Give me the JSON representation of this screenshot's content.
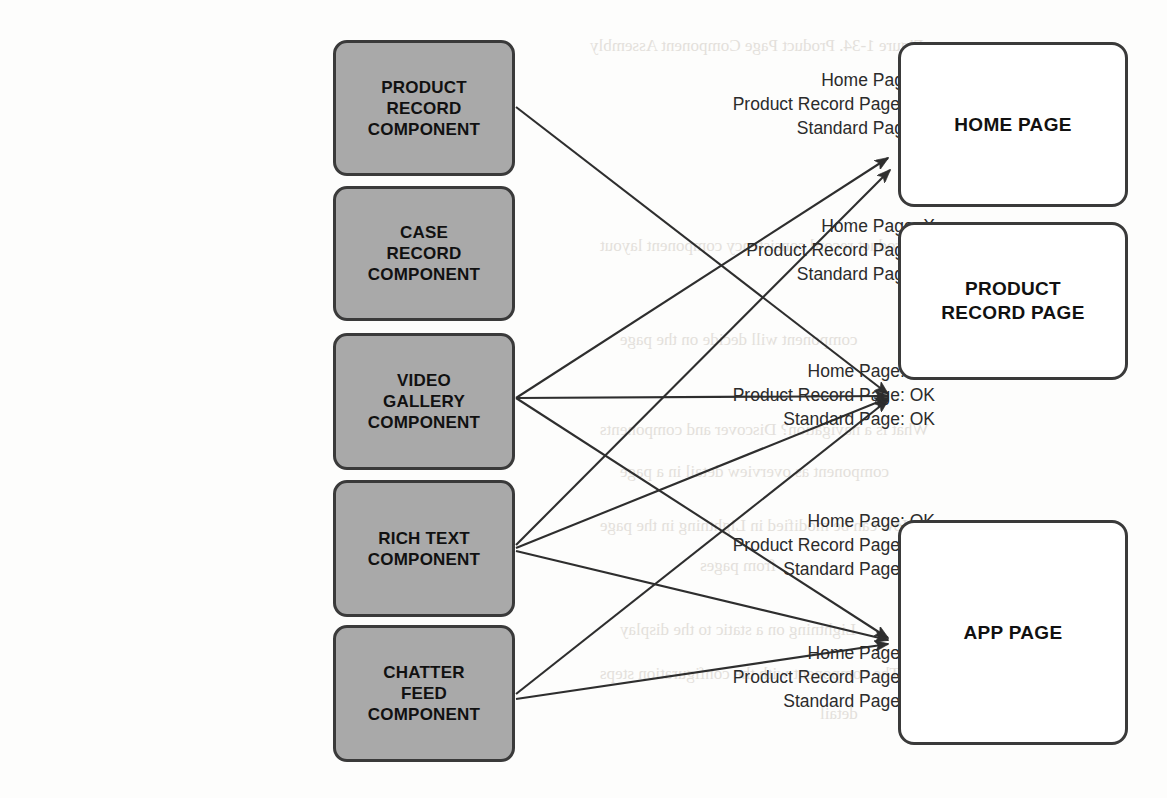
{
  "diagram": {
    "colors": {
      "component_fill": "#a9a9a9",
      "page_fill": "#ffffff",
      "border": "#3a3a3a",
      "text": "#111111",
      "annotation_text": "#2b2b2b",
      "background": "#fdfdfc"
    }
  },
  "annotations": [
    {
      "id": "annot-product-record-component",
      "lines": [
        "Home Page: X",
        "Product Record Page: OK",
        "Standard Page: X"
      ],
      "right": 935,
      "top": 68
    },
    {
      "id": "annot-case-record-component",
      "lines": [
        "Home Page: X",
        "Product Record Page: X",
        "Standard Page: X"
      ],
      "right": 935,
      "top": 214
    },
    {
      "id": "annot-video-gallery-component",
      "lines": [
        "Home Page: OK",
        "Product Record Page: OK",
        "Standard Page: OK"
      ],
      "right": 935,
      "top": 359
    },
    {
      "id": "annot-rich-text-component",
      "lines": [
        "Home Page: OK",
        "Product Record Page: OK",
        "Standard Page: OK"
      ],
      "right": 935,
      "top": 509
    },
    {
      "id": "annot-chatter-feed-component",
      "lines": [
        "Home Page: OK",
        "Product Record Page: OK",
        "Standard Page: OK"
      ],
      "right": 935,
      "top": 641
    }
  ],
  "components": [
    {
      "id": "product-record-component",
      "lines": [
        "PRODUCT",
        "RECORD",
        "COMPONENT"
      ],
      "top": 40,
      "height": 136
    },
    {
      "id": "case-record-component",
      "lines": [
        "CASE",
        "RECORD",
        "COMPONENT"
      ],
      "top": 186,
      "height": 135
    },
    {
      "id": "video-gallery-component",
      "lines": [
        "VIDEO",
        "GALLERY",
        "COMPONENT"
      ],
      "top": 333,
      "height": 137
    },
    {
      "id": "rich-text-component",
      "lines": [
        "RICH TEXT",
        "COMPONENT"
      ],
      "top": 480,
      "height": 137
    },
    {
      "id": "chatter-feed-component",
      "lines": [
        "CHATTER",
        "FEED",
        "COMPONENT"
      ],
      "top": 625,
      "height": 137
    }
  ],
  "pages": [
    {
      "id": "home-page",
      "lines": [
        "HOME PAGE"
      ],
      "top": 42,
      "height": 165
    },
    {
      "id": "product-record-page",
      "lines": [
        "PRODUCT",
        "RECORD PAGE"
      ],
      "top": 222,
      "height": 158
    },
    {
      "id": "app-page",
      "lines": [
        "APP PAGE"
      ],
      "top": 520,
      "height": 225
    }
  ],
  "connections": [
    {
      "id": "conn-product-record-component-to-product-record-page",
      "from": "product-record-component",
      "to": "product-record-page",
      "x1": 516,
      "y1": 107,
      "x2": 888,
      "y2": 394
    },
    {
      "id": "conn-video-gallery-to-home-page",
      "from": "video-gallery-component",
      "to": "home-page",
      "x1": 516,
      "y1": 398,
      "x2": 888,
      "y2": 158
    },
    {
      "id": "conn-video-gallery-to-product-record-page",
      "from": "video-gallery-component",
      "to": "product-record-page",
      "x1": 516,
      "y1": 398,
      "x2": 888,
      "y2": 396
    },
    {
      "id": "conn-video-gallery-to-app-page",
      "from": "video-gallery-component",
      "to": "app-page",
      "x1": 516,
      "y1": 398,
      "x2": 888,
      "y2": 638
    },
    {
      "id": "conn-rich-text-to-home-page",
      "from": "rich-text-component",
      "to": "home-page",
      "x1": 516,
      "y1": 545,
      "x2": 890,
      "y2": 170
    },
    {
      "id": "conn-rich-text-to-product-record-page",
      "from": "rich-text-component",
      "to": "product-record-page",
      "x1": 516,
      "y1": 548,
      "x2": 888,
      "y2": 398
    },
    {
      "id": "conn-rich-text-to-app-page",
      "from": "rich-text-component",
      "to": "app-page",
      "x1": 516,
      "y1": 551,
      "x2": 888,
      "y2": 640
    },
    {
      "id": "conn-chatter-feed-to-product-record-page",
      "from": "chatter-feed-component",
      "to": "product-record-page",
      "x1": 516,
      "y1": 694,
      "x2": 888,
      "y2": 400
    },
    {
      "id": "conn-chatter-feed-to-app-page",
      "from": "chatter-feed-component",
      "to": "app-page",
      "x1": 516,
      "y1": 699,
      "x2": 888,
      "y2": 644
    }
  ],
  "bleed_text": [
    {
      "text": "Figure 1-34. Product Page Component Assembly",
      "left": 590,
      "top": 36
    },
    {
      "text": "Examine in the product record consistency component layout",
      "left": 600,
      "top": 236
    },
    {
      "text": "source name",
      "left": 930,
      "top": 286
    },
    {
      "text": "component will decide on the page",
      "left": 620,
      "top": 330
    },
    {
      "text": "What is a navigation? Discover and components",
      "left": 600,
      "top": 420
    },
    {
      "text": "component as overview detail in a page",
      "left": 620,
      "top": 462
    },
    {
      "text": "How can be modified in Lightning in the page",
      "left": 600,
      "top": 516
    },
    {
      "text": "from pages",
      "left": 700,
      "top": 556
    },
    {
      "text": "Lightning on a static to the display",
      "left": 620,
      "top": 620
    },
    {
      "text": "The component with the configuration steps",
      "left": 600,
      "top": 664
    },
    {
      "text": "detail",
      "left": 820,
      "top": 704
    }
  ]
}
